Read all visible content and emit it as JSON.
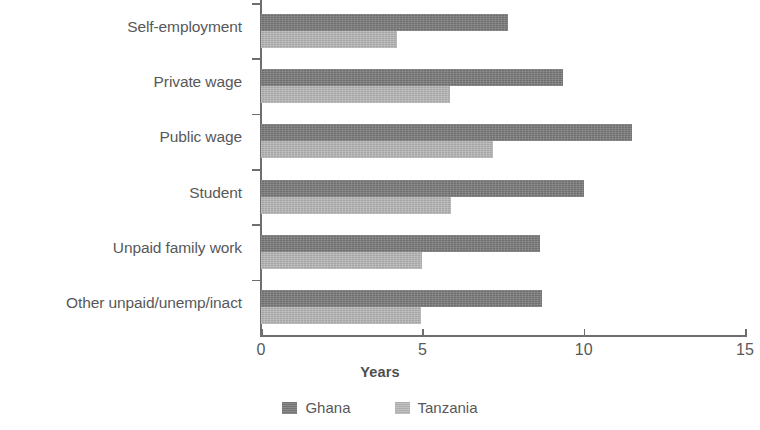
{
  "chart_data": {
    "type": "bar",
    "orientation": "horizontal",
    "title": "",
    "xlabel": "Years",
    "ylabel": "",
    "xlim": [
      0,
      15
    ],
    "xticks": [
      0,
      5,
      10,
      15
    ],
    "xtick_labels": [
      "0",
      "5",
      "10",
      "15"
    ],
    "grid": false,
    "legend_position": "bottom",
    "categories": [
      "Self-employment",
      "Private wage",
      "Public wage",
      "Student",
      "Unpaid family work",
      "Other unpaid/unemp/inact"
    ],
    "series": [
      {
        "name": "Ghana",
        "color": "#7a7a7a",
        "values": [
          7.65,
          9.35,
          11.5,
          10.0,
          8.65,
          8.7
        ]
      },
      {
        "name": "Tanzania",
        "color": "#b7b7b7",
        "values": [
          4.2,
          5.85,
          7.2,
          5.9,
          5.0,
          4.95
        ]
      }
    ]
  },
  "axis": {
    "x_title": "Years"
  },
  "legend": {
    "items": [
      {
        "label": "Ghana",
        "color": "#7a7a7a"
      },
      {
        "label": "Tanzania",
        "color": "#b7b7b7"
      }
    ]
  }
}
